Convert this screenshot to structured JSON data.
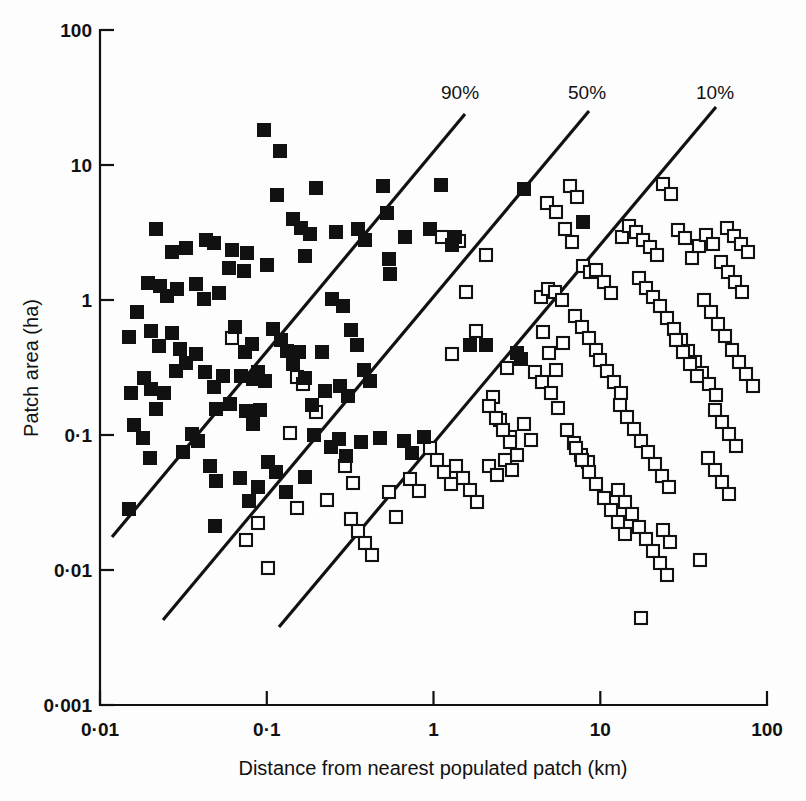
{
  "chart_data": {
    "type": "scatter",
    "title": "",
    "xlabel": "Distance from nearest populated patch (km)",
    "ylabel": "Patch area (ha)",
    "xscale": "log",
    "yscale": "log",
    "xlim": [
      0.01,
      100
    ],
    "ylim": [
      0.001,
      100
    ],
    "xticks": [
      "0·01",
      "0·1",
      "1",
      "10",
      "100"
    ],
    "yticks": [
      "100",
      "10",
      "1",
      "0·1",
      "0·01",
      "0·001"
    ],
    "grid": false,
    "legend": "none",
    "annotations": [
      {
        "label": "90%",
        "x": 441,
        "y": 99
      },
      {
        "label": "50%",
        "x": 568,
        "y": 99
      },
      {
        "label": "10%",
        "x": 696,
        "y": 99
      }
    ],
    "iso_lines": [
      {
        "name": "90%",
        "x1": 112,
        "y1": 537,
        "x2": 465,
        "y2": 114
      },
      {
        "name": "50%",
        "x1": 163,
        "y1": 620,
        "x2": 589,
        "y2": 111
      },
      {
        "name": "10%",
        "x1": 279,
        "y1": 627,
        "x2": 716,
        "y2": 107
      }
    ],
    "series": [
      {
        "name": "occupied",
        "marker": "filled-square",
        "color": "#111111",
        "points_px": [
          [
            264,
            130
          ],
          [
            280,
            151
          ],
          [
            277,
            195
          ],
          [
            316,
            188
          ],
          [
            310,
            234
          ],
          [
            293,
            219
          ],
          [
            301,
            228
          ],
          [
            267,
            265
          ],
          [
            247,
            253
          ],
          [
            244,
            271
          ],
          [
            305,
            256
          ],
          [
            336,
            232
          ],
          [
            358,
            229
          ],
          [
            365,
            240
          ],
          [
            383,
            186
          ],
          [
            387,
            213
          ],
          [
            389,
            259
          ],
          [
            390,
            274
          ],
          [
            405,
            237
          ],
          [
            430,
            229
          ],
          [
            441,
            185
          ],
          [
            452,
            245
          ],
          [
            455,
            237
          ],
          [
            524,
            189
          ],
          [
            583,
            222
          ],
          [
            156,
            229
          ],
          [
            172,
            252
          ],
          [
            186,
            248
          ],
          [
            206,
            240
          ],
          [
            214,
            243
          ],
          [
            232,
            250
          ],
          [
            229,
            268
          ],
          [
            160,
            286
          ],
          [
            167,
            296
          ],
          [
            177,
            289
          ],
          [
            196,
            284
          ],
          [
            204,
            299
          ],
          [
            219,
            293
          ],
          [
            148,
            283
          ],
          [
            129,
            337
          ],
          [
            137,
            312
          ],
          [
            151,
            331
          ],
          [
            159,
            346
          ],
          [
            172,
            333
          ],
          [
            180,
            349
          ],
          [
            186,
            363
          ],
          [
            196,
            354
          ],
          [
            176,
            371
          ],
          [
            144,
            378
          ],
          [
            131,
            393
          ],
          [
            151,
            389
          ],
          [
            164,
            393
          ],
          [
            205,
            372
          ],
          [
            214,
            387
          ],
          [
            223,
            376
          ],
          [
            241,
            376
          ],
          [
            253,
            379
          ],
          [
            258,
            372
          ],
          [
            265,
            381
          ],
          [
            252,
            344
          ],
          [
            235,
            327
          ],
          [
            245,
            352
          ],
          [
            273,
            329
          ],
          [
            281,
            340
          ],
          [
            287,
            351
          ],
          [
            293,
            364
          ],
          [
            299,
            352
          ],
          [
            305,
            378
          ],
          [
            312,
            405
          ],
          [
            325,
            391
          ],
          [
            322,
            352
          ],
          [
            332,
            299
          ],
          [
            343,
            306
          ],
          [
            351,
            330
          ],
          [
            357,
            345
          ],
          [
            340,
            386
          ],
          [
            348,
            396
          ],
          [
            364,
            370
          ],
          [
            370,
            381
          ],
          [
            216,
            409
          ],
          [
            230,
            404
          ],
          [
            246,
            411
          ],
          [
            253,
            424
          ],
          [
            260,
            410
          ],
          [
            192,
            434
          ],
          [
            198,
            441
          ],
          [
            183,
            452
          ],
          [
            210,
            466
          ],
          [
            216,
            481
          ],
          [
            240,
            478
          ],
          [
            268,
            462
          ],
          [
            276,
            472
          ],
          [
            156,
            409
          ],
          [
            134,
            425
          ],
          [
            143,
            438
          ],
          [
            150,
            458
          ],
          [
            129,
            509
          ],
          [
            215,
            526
          ],
          [
            314,
            435
          ],
          [
            331,
            447
          ],
          [
            339,
            439
          ],
          [
            346,
            456
          ],
          [
            361,
            442
          ],
          [
            380,
            438
          ],
          [
            404,
            441
          ],
          [
            412,
            453
          ],
          [
            424,
            437
          ],
          [
            470,
            345
          ],
          [
            486,
            345
          ],
          [
            517,
            353
          ],
          [
            521,
            359
          ],
          [
            249,
            501
          ],
          [
            258,
            487
          ],
          [
            305,
            477
          ],
          [
            286,
            492
          ]
        ]
      },
      {
        "name": "unoccupied",
        "marker": "open-square",
        "color": "#ffffff",
        "points_px": [
          [
            232,
            338
          ],
          [
            297,
            377
          ],
          [
            303,
            384
          ],
          [
            290,
            433
          ],
          [
            297,
            508
          ],
          [
            258,
            523
          ],
          [
            246,
            540
          ],
          [
            268,
            568
          ],
          [
            316,
            412
          ],
          [
            327,
            500
          ],
          [
            345,
            466
          ],
          [
            353,
            483
          ],
          [
            389,
            492
          ],
          [
            410,
            479
          ],
          [
            419,
            491
          ],
          [
            396,
            517
          ],
          [
            442,
            237
          ],
          [
            452,
            354
          ],
          [
            459,
            241
          ],
          [
            466,
            292
          ],
          [
            476,
            331
          ],
          [
            486,
            255
          ],
          [
            493,
            397
          ],
          [
            500,
            420
          ],
          [
            507,
            368
          ],
          [
            510,
            437
          ],
          [
            517,
            455
          ],
          [
            524,
            424
          ],
          [
            531,
            440
          ],
          [
            489,
            466
          ],
          [
            497,
            475
          ],
          [
            505,
            460
          ],
          [
            512,
            470
          ],
          [
            541,
            297
          ],
          [
            548,
            289
          ],
          [
            555,
            292
          ],
          [
            562,
            300
          ],
          [
            543,
            332
          ],
          [
            549,
            353
          ],
          [
            556,
            370
          ],
          [
            563,
            343
          ],
          [
            535,
            372
          ],
          [
            542,
            382
          ],
          [
            551,
            393
          ],
          [
            558,
            408
          ],
          [
            547,
            203
          ],
          [
            556,
            212
          ],
          [
            565,
            229
          ],
          [
            572,
            242
          ],
          [
            570,
            186
          ],
          [
            577,
            197
          ],
          [
            583,
            266
          ],
          [
            590,
            272
          ],
          [
            575,
            316
          ],
          [
            582,
            327
          ],
          [
            589,
            338
          ],
          [
            596,
            350
          ],
          [
            567,
            430
          ],
          [
            574,
            443
          ],
          [
            581,
            455
          ],
          [
            588,
            462
          ],
          [
            600,
            360
          ],
          [
            607,
            371
          ],
          [
            614,
            382
          ],
          [
            621,
            393
          ],
          [
            596,
            270
          ],
          [
            604,
            282
          ],
          [
            611,
            293
          ],
          [
            622,
            237
          ],
          [
            629,
            226
          ],
          [
            636,
            232
          ],
          [
            643,
            240
          ],
          [
            650,
            247
          ],
          [
            657,
            255
          ],
          [
            663,
            184
          ],
          [
            671,
            194
          ],
          [
            678,
            230
          ],
          [
            685,
            238
          ],
          [
            692,
            258
          ],
          [
            699,
            246
          ],
          [
            706,
            235
          ],
          [
            713,
            244
          ],
          [
            639,
            278
          ],
          [
            646,
            288
          ],
          [
            653,
            297
          ],
          [
            660,
            306
          ],
          [
            667,
            318
          ],
          [
            674,
            329
          ],
          [
            681,
            340
          ],
          [
            688,
            351
          ],
          [
            695,
            362
          ],
          [
            702,
            373
          ],
          [
            709,
            384
          ],
          [
            716,
            395
          ],
          [
            620,
            405
          ],
          [
            627,
            417
          ],
          [
            634,
            429
          ],
          [
            641,
            441
          ],
          [
            648,
            452
          ],
          [
            655,
            464
          ],
          [
            662,
            476
          ],
          [
            669,
            487
          ],
          [
            676,
            340
          ],
          [
            683,
            352
          ],
          [
            690,
            364
          ],
          [
            697,
            376
          ],
          [
            704,
            300
          ],
          [
            711,
            312
          ],
          [
            718,
            324
          ],
          [
            725,
            336
          ],
          [
            732,
            350
          ],
          [
            739,
            362
          ],
          [
            746,
            374
          ],
          [
            753,
            386
          ],
          [
            727,
            228
          ],
          [
            734,
            236
          ],
          [
            741,
            244
          ],
          [
            748,
            252
          ],
          [
            721,
            262
          ],
          [
            728,
            272
          ],
          [
            735,
            282
          ],
          [
            742,
            292
          ],
          [
            715,
            410
          ],
          [
            722,
            422
          ],
          [
            729,
            434
          ],
          [
            736,
            446
          ],
          [
            708,
            458
          ],
          [
            715,
            470
          ],
          [
            722,
            482
          ],
          [
            729,
            494
          ],
          [
            618,
            490
          ],
          [
            625,
            502
          ],
          [
            632,
            514
          ],
          [
            639,
            527
          ],
          [
            646,
            539
          ],
          [
            653,
            551
          ],
          [
            660,
            563
          ],
          [
            667,
            575
          ],
          [
            641,
            618
          ],
          [
            700,
            560
          ],
          [
            663,
            530
          ],
          [
            670,
            542
          ],
          [
            576,
            448
          ],
          [
            582,
            460
          ],
          [
            589,
            472
          ],
          [
            596,
            484
          ],
          [
            604,
            498
          ],
          [
            611,
            510
          ],
          [
            618,
            522
          ],
          [
            625,
            534
          ],
          [
            489,
            406
          ],
          [
            496,
            418
          ],
          [
            503,
            430
          ],
          [
            510,
            442
          ],
          [
            456,
            466
          ],
          [
            463,
            478
          ],
          [
            470,
            490
          ],
          [
            477,
            502
          ],
          [
            430,
            448
          ],
          [
            437,
            460
          ],
          [
            444,
            472
          ],
          [
            451,
            484
          ],
          [
            351,
            519
          ],
          [
            358,
            531
          ],
          [
            365,
            543
          ],
          [
            372,
            555
          ]
        ]
      }
    ],
    "note": "points_px are pixel coordinates in an 806x801 canvas; axes: x pixel 100 = 0.01 km, 166.75 px per decade; y pixel 30 = 100 ha, 135 px per decade"
  },
  "axes": {
    "plot_left": 100,
    "plot_right": 767,
    "plot_top": 30,
    "plot_bottom": 705,
    "px_per_decade_x": 166.75,
    "px_per_decade_y": 135.0
  }
}
